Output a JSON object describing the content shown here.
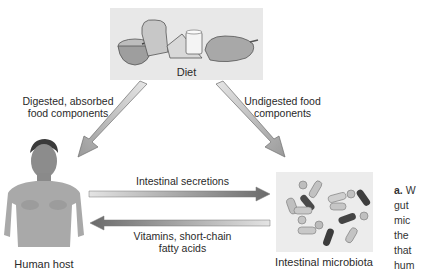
{
  "diagram": {
    "nodes": {
      "diet": {
        "label": "Diet"
      },
      "human_host": {
        "label": "Human host"
      },
      "microbiota": {
        "label": "Intestinal microbiota"
      }
    },
    "edges": {
      "diet_to_host": {
        "label_line1": "Digested, absorbed",
        "label_line2": "food components"
      },
      "diet_to_microbiota": {
        "label_line1": "Undigested food",
        "label_line2": "components"
      },
      "host_to_microbiota": {
        "label": "Intestinal secretions"
      },
      "microbiota_to_host": {
        "label_line1": "Vitamins, short-chain",
        "label_line2": "fatty acids"
      }
    },
    "caption_fragment": {
      "prefix": "a.",
      "lines": [
        "W",
        "gut",
        "mic",
        "the",
        "that",
        "hum"
      ]
    }
  },
  "colors": {
    "arrow_dark": "#707070",
    "arrow_light": "#e0e0e0",
    "box_bg": "#e8e8e8"
  }
}
